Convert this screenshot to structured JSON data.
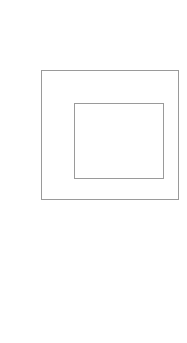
{
  "diagram": {
    "type": "nested-rectangles",
    "background_color": "#ffffff",
    "stroke_color": "#9a9a9a",
    "shapes": [
      {
        "id": "outer",
        "kind": "rectangle",
        "x": 41,
        "y": 70,
        "width": 138,
        "height": 130
      },
      {
        "id": "inner",
        "kind": "rectangle",
        "x": 74,
        "y": 103,
        "width": 90,
        "height": 76
      }
    ]
  }
}
